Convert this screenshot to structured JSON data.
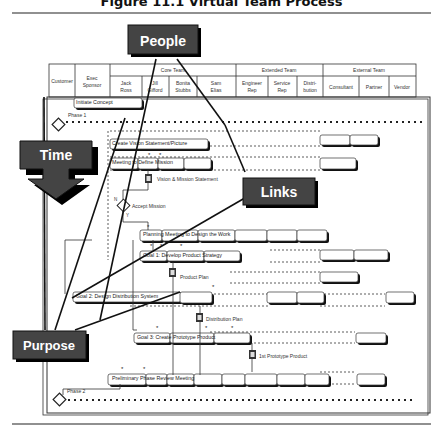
{
  "figure": {
    "title": "Figure 11.1    Virtual Team Process"
  },
  "callouts": {
    "people": "People",
    "time": "Time",
    "links": "Links",
    "purpose": "Purpose"
  },
  "header": {
    "columns": [
      {
        "label": "Customer"
      },
      {
        "label": "Exec Sponsor",
        "lines": [
          "Exec",
          "Sponsor"
        ]
      },
      {
        "group": "Core Team",
        "members": [
          {
            "lines": [
              "Jack",
              "Ross"
            ]
          },
          {
            "lines": [
              "Jill",
              "Gifford"
            ]
          },
          {
            "lines": [
              "Bonita",
              "Stubbs"
            ]
          },
          {
            "lines": [
              "Sam",
              "Elias"
            ]
          }
        ]
      },
      {
        "group": "Extended Team",
        "members": [
          {
            "lines": [
              "Engineer",
              "Rep"
            ]
          },
          {
            "lines": [
              "Service",
              "Rep"
            ]
          },
          {
            "lines": [
              "Distri-",
              "bution"
            ]
          }
        ]
      },
      {
        "group": "External Team",
        "members": [
          {
            "lines": [
              "Consultant"
            ]
          },
          {
            "lines": [
              "Partner"
            ]
          },
          {
            "lines": [
              "Vendor"
            ]
          }
        ]
      }
    ],
    "core_team_label": "Core Team",
    "extended_team_label": "Extended Team",
    "external_team_label": "External Team",
    "customer_label": "Customer",
    "exec_label_1": "Exec",
    "exec_label_2": "Sponsor"
  },
  "phases": {
    "phase1": "Phase 1",
    "phase2": "Phase 2"
  },
  "tasks": {
    "initiate": "Initiate Concept",
    "vision": "Create Vision Statement/Picture",
    "mission_meeting": "Meeting to Define Mission",
    "planning": "Planning Meeting to Design the Work",
    "goal1": "Goal 1: Develop Product Strategy",
    "goal2": "Goal 2: Design Distribution System",
    "goal3": "Goal 3: Create Prototype Product",
    "review": "Preliminary Phase Review Meeting"
  },
  "documents": {
    "vision_doc": "Vision & Mission Statement",
    "product_plan": "Product Plan",
    "distribution_plan": "Distribution Plan",
    "prototype": "1st Prototype Product"
  },
  "decision": {
    "label": "Accept Mission",
    "no": "N",
    "yes": "Y"
  }
}
